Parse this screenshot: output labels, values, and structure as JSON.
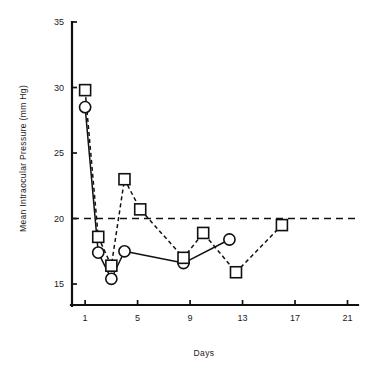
{
  "chart_data": {
    "type": "line",
    "title": "",
    "subtitle": "",
    "xlabel": "Days",
    "ylabel": "Mean Intraocular Pressure (mm Hg)",
    "xlim": [
      0,
      21.8
    ],
    "ylim": [
      13.4,
      35
    ],
    "xticks": [
      1,
      5,
      9,
      13,
      17,
      21
    ],
    "xtick_labels": [
      "1",
      "5",
      "9",
      "13",
      "17",
      "21"
    ],
    "yticks": [
      15,
      20,
      25,
      30,
      35
    ],
    "ytick_labels": [
      "15",
      "20",
      "25",
      "30",
      "35"
    ],
    "grid": false,
    "legend": "none",
    "annotations": [
      {
        "name": "reference-line",
        "kind": "hline",
        "value": 20,
        "style": "dashed",
        "label": ""
      }
    ],
    "series": [
      {
        "name": "circle-series",
        "marker": "circle",
        "line_style": "solid",
        "x": [
          1,
          2,
          3,
          4,
          8.5,
          12
        ],
        "y": [
          28.5,
          17.4,
          15.4,
          17.5,
          16.6,
          18.4
        ]
      },
      {
        "name": "square-series",
        "marker": "square",
        "line_style": "dashed",
        "x": [
          1,
          2,
          3,
          4,
          5.2,
          8.5,
          10,
          12.5,
          16
        ],
        "y": [
          29.8,
          18.6,
          16.4,
          23.0,
          20.7,
          17.0,
          18.9,
          15.9,
          19.5
        ]
      }
    ]
  },
  "layout": {
    "plot_left": 72,
    "plot_right": 358,
    "plot_top": 22,
    "plot_bottom": 305,
    "x_axis_y": 305,
    "y_axis_x": 72,
    "x_value_at_left": 0.0,
    "x_value_at_right": 21.8,
    "y_value_at_bottom": 13.4,
    "y_value_at_top": 35.0,
    "marker_size_square": 11,
    "marker_radius_circle": 5.6,
    "tick_length_x": 5,
    "tick_length_y": 5
  }
}
